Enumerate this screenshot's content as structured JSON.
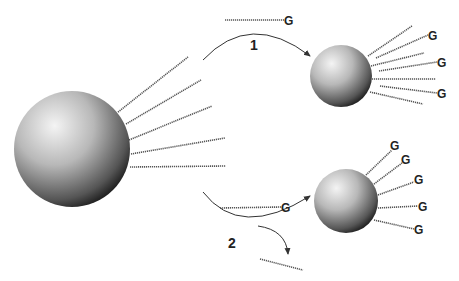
{
  "diagram": {
    "type": "schematic",
    "end_group_label": "G",
    "pathways": [
      {
        "label": "1",
        "free_chain_end": "G"
      },
      {
        "label": "2",
        "free_chain_end": "G",
        "released_chain_end": ""
      }
    ],
    "colors": {
      "chain": "#555555",
      "arrow": "#333333",
      "sphere_light": "#f2f2f2",
      "sphere_dark": "#222222",
      "text": "#222222"
    }
  }
}
